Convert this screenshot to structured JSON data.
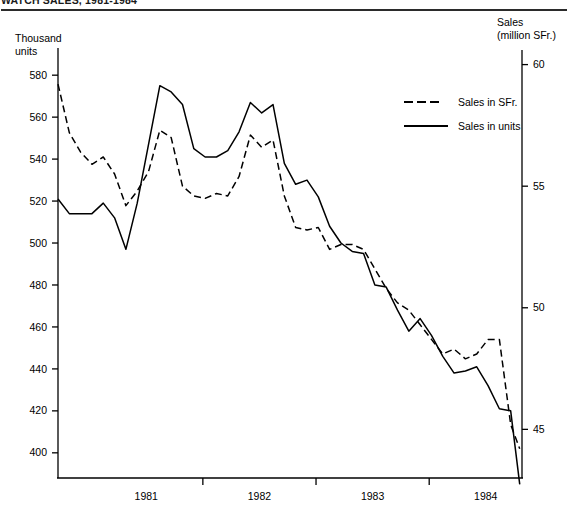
{
  "header": {
    "title": "WATCH SALES, 1981-1984",
    "title_clipped": true
  },
  "legend": {
    "position": "inside-top-right",
    "entries": [
      {
        "label": "Sales in SFr.",
        "style": "dashed"
      },
      {
        "label": "Sales in units",
        "style": "solid"
      }
    ]
  },
  "axes": {
    "left_caption_line1": "Thousand",
    "left_caption_line2": "units",
    "right_caption_line1": "Sales",
    "right_caption_line2": "(million SFr.)",
    "left_ticks": [
      "400",
      "420",
      "440",
      "460",
      "480",
      "500",
      "520",
      "540",
      "560",
      "580"
    ],
    "right_ticks": [
      "45",
      "50",
      "55",
      "60"
    ],
    "year_labels": [
      "1981",
      "1982",
      "1983",
      "1984"
    ]
  },
  "chart_data": {
    "type": "line",
    "title": "WATCH SALES, 1981-1984",
    "xlabel": "",
    "ylabel": "Thousand units",
    "y2label": "Sales (million SFr.)",
    "grid": false,
    "legend_position": "inside-top-right",
    "xlim": [
      1980.62,
      1984.72
    ],
    "ylim": [
      388,
      592
    ],
    "y2lim": [
      43.0,
      60.6
    ],
    "ytick_values": [
      400,
      420,
      440,
      460,
      480,
      500,
      520,
      540,
      560,
      580
    ],
    "y2tick_values": [
      45,
      50,
      55,
      60
    ],
    "year_tick_positions": [
      1981.4,
      1982.4,
      1983.4,
      1984.4
    ],
    "x_unit": "quarter",
    "series": [
      {
        "name": "Sales in SFr.",
        "style": "dashed",
        "axis": "right",
        "units": "million SFr.",
        "x": [
          1980.62,
          1980.72,
          1980.82,
          1980.92,
          1981.02,
          1981.12,
          1981.22,
          1981.32,
          1981.42,
          1981.52,
          1981.62,
          1981.72,
          1981.82,
          1981.92,
          1982.02,
          1982.12,
          1982.22,
          1982.32,
          1982.42,
          1982.52,
          1982.62,
          1982.72,
          1982.82,
          1982.92,
          1983.02,
          1983.12,
          1983.22,
          1983.32,
          1983.42,
          1983.52,
          1983.62,
          1983.72,
          1983.82,
          1983.92,
          1984.02,
          1984.12,
          1984.22,
          1984.32,
          1984.42,
          1984.52,
          1984.62,
          1984.7
        ],
        "values_right_axis": [
          59.2,
          57.2,
          56.4,
          55.9,
          56.2,
          55.5,
          54.2,
          54.8,
          55.6,
          57.3,
          57.0,
          55.0,
          54.6,
          54.5,
          54.7,
          54.6,
          55.4,
          57.1,
          56.6,
          56.9,
          54.6,
          53.3,
          53.2,
          53.3,
          52.4,
          52.6,
          52.6,
          52.4,
          51.6,
          50.8,
          50.2,
          49.9,
          49.3,
          48.7,
          48.1,
          48.3,
          47.9,
          48.1,
          48.7,
          48.7,
          45.2,
          44.2
        ],
        "values_left_axis_equivalent": [
          589,
          566,
          557,
          551,
          555,
          547,
          532,
          538,
          547,
          567,
          563,
          541,
          536,
          535,
          537,
          536,
          545,
          565,
          559,
          563,
          536,
          521,
          520,
          521,
          510,
          513,
          513,
          510,
          501,
          492,
          485,
          482,
          475,
          468,
          461,
          464,
          459,
          462,
          468,
          468,
          427,
          416
        ]
      },
      {
        "name": "Sales in units",
        "style": "solid",
        "axis": "left",
        "units": "thousand units",
        "x": [
          1980.62,
          1980.72,
          1980.82,
          1980.92,
          1981.02,
          1981.12,
          1981.22,
          1981.32,
          1981.42,
          1981.52,
          1981.62,
          1981.72,
          1981.82,
          1981.92,
          1982.02,
          1982.12,
          1982.22,
          1982.32,
          1982.42,
          1982.52,
          1982.62,
          1982.72,
          1982.82,
          1982.92,
          1983.02,
          1983.12,
          1983.22,
          1983.32,
          1983.42,
          1983.52,
          1983.62,
          1983.72,
          1983.82,
          1983.92,
          1984.02,
          1984.12,
          1984.22,
          1984.32,
          1984.42,
          1984.52,
          1984.62,
          1984.7
        ],
        "values": [
          521,
          514,
          514,
          514,
          519,
          512,
          497,
          519,
          547,
          575,
          572,
          566,
          545,
          541,
          541,
          544,
          553,
          567,
          562,
          566,
          538,
          528,
          530,
          522,
          508,
          500,
          496,
          495,
          480,
          479,
          468,
          458,
          464,
          456,
          446,
          438,
          439,
          441,
          432,
          421,
          420,
          385
        ]
      }
    ]
  }
}
